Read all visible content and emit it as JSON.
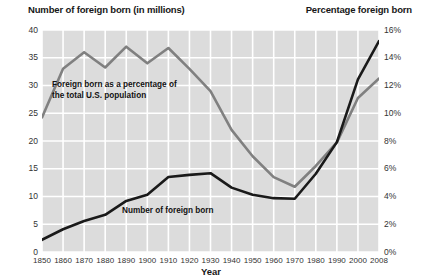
{
  "header": {
    "left_title": "Number of foreign born (in millions)",
    "right_title": "Percentage foreign born"
  },
  "annotations": {
    "percentage_line_label_1": "Foreign born as a percentage of",
    "percentage_line_label_2": "the total U.S. population",
    "number_line_label": "Number of foreign born"
  },
  "colors": {
    "plot_background": "#dcdcdc",
    "gridline": "#ffffff",
    "number_series": "#1a1a1a",
    "percentage_series": "#808080",
    "text": "#171717"
  },
  "chart_data": {
    "type": "line",
    "title": "",
    "xlabel": "Year",
    "ylabel": "Number of foreign born (in millions)",
    "y2label": "Percentage foreign born",
    "grid": true,
    "legend": "inline-annotations",
    "x": [
      1850,
      1860,
      1870,
      1880,
      1890,
      1900,
      1910,
      1920,
      1930,
      1940,
      1950,
      1960,
      1970,
      1980,
      1990,
      2000,
      2008
    ],
    "xtick_labels": [
      "1850",
      "1860",
      "1870",
      "1880",
      "1890",
      "1900",
      "1910",
      "1920",
      "1930",
      "1940",
      "1950",
      "1960",
      "1970",
      "1980",
      "1990",
      "2000",
      "2008"
    ],
    "ylim": [
      0,
      40
    ],
    "ytick_labels": [
      "0",
      "5",
      "10",
      "15",
      "20",
      "25",
      "30",
      "35",
      "40"
    ],
    "yticks": [
      0,
      5,
      10,
      15,
      20,
      25,
      30,
      35,
      40
    ],
    "y2lim": [
      0,
      16
    ],
    "y2tick_labels": [
      "0%",
      "2%",
      "4%",
      "6%",
      "8%",
      "10%",
      "12%",
      "14%",
      "16%"
    ],
    "y2ticks": [
      0,
      2,
      4,
      6,
      8,
      10,
      12,
      14,
      16
    ],
    "series": [
      {
        "name": "Number of foreign born",
        "axis": "left",
        "units": "millions",
        "color": "#1a1a1a",
        "values": [
          2.2,
          4.1,
          5.6,
          6.7,
          9.2,
          10.3,
          13.5,
          13.9,
          14.2,
          11.6,
          10.3,
          9.7,
          9.6,
          14.1,
          19.8,
          31.1,
          38.0
        ]
      },
      {
        "name": "Foreign born as a percentage of the total U.S. population",
        "axis": "right",
        "units": "percent",
        "color": "#808080",
        "values": [
          9.7,
          13.2,
          14.4,
          13.3,
          14.8,
          13.6,
          14.7,
          13.2,
          11.6,
          8.8,
          6.9,
          5.4,
          4.7,
          6.2,
          7.9,
          11.1,
          12.5
        ]
      }
    ]
  }
}
